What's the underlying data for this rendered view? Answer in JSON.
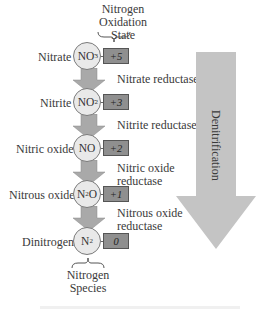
{
  "header": {
    "title_line1": "Nitrogen",
    "title_line2": "Oxidation",
    "title_line3": "State"
  },
  "species": [
    {
      "name": "Nitrate",
      "formula_base": "NO",
      "formula_sub": "3",
      "formula_sup": "-",
      "oxidation_state": "+5"
    },
    {
      "name": "Nitrite",
      "formula_base": "NO",
      "formula_sub": "2",
      "formula_sup": "-",
      "oxidation_state": "+3"
    },
    {
      "name": "Nitric oxide",
      "formula_base": "NO",
      "formula_sub": "",
      "formula_sup": "",
      "oxidation_state": "+2"
    },
    {
      "name": "Nitrous oxide",
      "formula_base": "N",
      "formula_sub": "2",
      "formula_tail": "O",
      "formula_sup": "",
      "oxidation_state": "+1"
    },
    {
      "name": "Dinitrogen",
      "formula_base": "N",
      "formula_sub": "2",
      "formula_sup": "",
      "oxidation_state": "0"
    }
  ],
  "enzymes": [
    {
      "line1": "Nitrate reductase",
      "line2": ""
    },
    {
      "line1": "Nitrite reductase",
      "line2": ""
    },
    {
      "line1": "Nitric oxide",
      "line2": "reductase"
    },
    {
      "line1": "Nitrous oxide",
      "line2": "reductase"
    }
  ],
  "process_arrow": {
    "label": "Denitrification",
    "color": "#c4c4c4"
  },
  "footer": {
    "label_line1": "Nitrogen",
    "label_line2": "Species"
  },
  "colors": {
    "circle_fill": "#e9e9e9",
    "oxidation_box_fill": "#8f8f8f",
    "step_arrow_fill": "#a9a9a9",
    "big_arrow_fill": "#c4c4c4"
  }
}
